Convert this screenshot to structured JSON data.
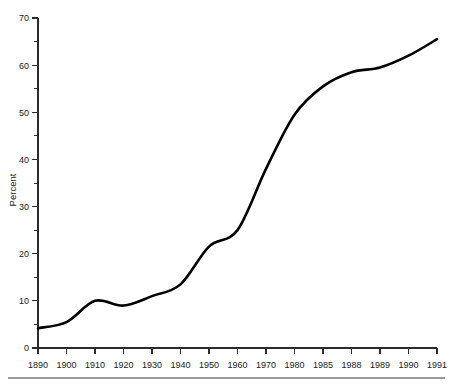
{
  "chart_data": {
    "type": "line",
    "title": "",
    "subtitle": "",
    "xlabel": "",
    "ylabel": "Percent",
    "categories": [
      "1890",
      "1900",
      "1910",
      "1920",
      "1930",
      "1940",
      "1950",
      "1960",
      "1970",
      "1980",
      "1985",
      "1988",
      "1989",
      "1990",
      "1991"
    ],
    "values": [
      4.2,
      5.5,
      10.0,
      9.0,
      11.0,
      13.5,
      21.5,
      25.0,
      38.0,
      49.5,
      55.5,
      58.5,
      59.5,
      62.0,
      65.5
    ],
    "series": [
      {
        "name": "Percent",
        "values": [
          4.2,
          5.5,
          10.0,
          9.0,
          11.0,
          13.5,
          21.5,
          25.0,
          38.0,
          49.5,
          55.5,
          58.5,
          59.5,
          62.0,
          65.5
        ]
      }
    ],
    "ylim": [
      0,
      70
    ],
    "y_ticks": [
      0,
      10,
      20,
      30,
      40,
      50,
      60,
      70
    ],
    "y_tick_labels": [
      "0",
      "10",
      "20",
      "30",
      "40",
      "50",
      "60",
      "70"
    ],
    "y_minor_ticks": [
      5,
      15,
      25,
      35,
      45,
      55,
      65
    ],
    "x_tick_labels": [
      "1890",
      "1900",
      "1910",
      "1920",
      "1930",
      "1940",
      "1950",
      "1960",
      "1970",
      "1980",
      "1985",
      "1988",
      "1989",
      "1990",
      "1991"
    ],
    "grid": false,
    "legend": false,
    "legend_position": "none",
    "line_color": "#000000",
    "axis_color": "#2b2b2b",
    "annotations": []
  },
  "figure": {
    "footer_rule_color": "#9a9a9a"
  }
}
